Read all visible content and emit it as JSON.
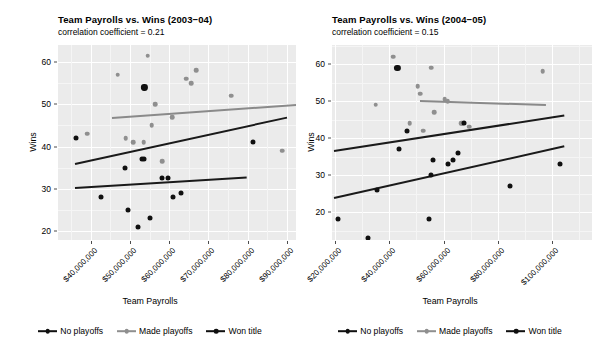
{
  "chart_data": [
    {
      "id": "facet-2003-04",
      "type": "scatter",
      "title": "Team Payrolls vs. Wins (2003−04)",
      "subtitle": "correlation coefficient = 0.21",
      "xlabel": "Team Payrolls",
      "ylabel": "Wins",
      "grid": true,
      "legend_position": "bottom",
      "xlim": [
        34500000,
        95000000
      ],
      "ylim": [
        18.5,
        63
      ],
      "xticks": [
        40000000,
        50000000,
        60000000,
        70000000,
        80000000,
        90000000
      ],
      "xtick_labels": [
        "$40,000,000",
        "$50,000,000",
        "$60,000,000",
        "$70,000,000",
        "$80,000,000",
        "$90,000,000"
      ],
      "yticks": [
        20,
        30,
        40,
        50,
        60
      ],
      "ytick_labels": [
        "20",
        "30",
        "40",
        "50",
        "60"
      ],
      "series": [
        {
          "name": "No playoffs",
          "color": "#101010",
          "points": [
            {
              "x": 36200000,
              "y": 42
            },
            {
              "x": 42500000,
              "y": 28
            },
            {
              "x": 48700000,
              "y": 35
            },
            {
              "x": 49600000,
              "y": 25
            },
            {
              "x": 52000000,
              "y": 21
            },
            {
              "x": 53000000,
              "y": 37
            },
            {
              "x": 53600000,
              "y": 37
            },
            {
              "x": 55100000,
              "y": 23
            },
            {
              "x": 58100000,
              "y": 32.5
            },
            {
              "x": 59600000,
              "y": 32.5
            },
            {
              "x": 61000000,
              "y": 28
            },
            {
              "x": 63000000,
              "y": 29
            },
            {
              "x": 81500000,
              "y": 41
            }
          ]
        },
        {
          "name": "Made playoffs",
          "color": "#8f8f8f",
          "points": [
            {
              "x": 39100000,
              "y": 43
            },
            {
              "x": 46900000,
              "y": 57
            },
            {
              "x": 48900000,
              "y": 42
            },
            {
              "x": 50900000,
              "y": 41
            },
            {
              "x": 53500000,
              "y": 41
            },
            {
              "x": 54500000,
              "y": 61.5
            },
            {
              "x": 55600000,
              "y": 45
            },
            {
              "x": 56400000,
              "y": 50
            },
            {
              "x": 58300000,
              "y": 36.5
            },
            {
              "x": 60800000,
              "y": 47
            },
            {
              "x": 64400000,
              "y": 56
            },
            {
              "x": 65600000,
              "y": 55
            },
            {
              "x": 66900000,
              "y": 58
            },
            {
              "x": 75800000,
              "y": 52
            },
            {
              "x": 88800000,
              "y": 39
            }
          ]
        },
        {
          "name": "Won title",
          "color": "#101010",
          "points": [
            {
              "x": 53700000,
              "y": 54
            }
          ]
        }
      ],
      "fit_lines": [
        {
          "series": "Made playoffs",
          "color": "#8a8a8a",
          "x1": 45500000,
          "y1": 47,
          "x2": 94000000,
          "y2": 50.2
        },
        {
          "series": "Won title",
          "color": "#1a1a1a",
          "x1": 36000000,
          "y1": 36,
          "x2": 90200000,
          "y2": 47
        },
        {
          "series": "No playoffs",
          "color": "#1a1a1a",
          "x1": 36000000,
          "y1": 30.4,
          "x2": 79800000,
          "y2": 32.9
        }
      ]
    },
    {
      "id": "facet-2004-05",
      "type": "scatter",
      "title": "Team Payrolls vs. Wins (2004−05)",
      "subtitle": "correlation coefficient = 0.15",
      "xlabel": "Team Payrolls",
      "ylabel": "Wins",
      "grid": true,
      "legend_position": "bottom",
      "xlim": [
        17000000,
        110000000
      ],
      "ylim": [
        11,
        64
      ],
      "xticks": [
        20000000,
        40000000,
        60000000,
        80000000,
        100000000
      ],
      "xtick_labels": [
        "$20,000,000",
        "$40,000,000",
        "$60,000,000",
        "$80,000,000",
        "$100,000,000"
      ],
      "yticks": [
        20,
        30,
        40,
        50,
        60
      ],
      "ytick_labels": [
        "20",
        "30",
        "40",
        "50",
        "60"
      ],
      "series": [
        {
          "name": "No playoffs",
          "color": "#101010",
          "points": [
            {
              "x": 21000000,
              "y": 18
            },
            {
              "x": 32000000,
              "y": 13
            },
            {
              "x": 35500000,
              "y": 26
            },
            {
              "x": 43500000,
              "y": 37
            },
            {
              "x": 46500000,
              "y": 42
            },
            {
              "x": 54500000,
              "y": 18
            },
            {
              "x": 55500000,
              "y": 30
            },
            {
              "x": 56000000,
              "y": 34
            },
            {
              "x": 61500000,
              "y": 33
            },
            {
              "x": 63500000,
              "y": 34
            },
            {
              "x": 65500000,
              "y": 36
            },
            {
              "x": 67500000,
              "y": 44
            },
            {
              "x": 84500000,
              "y": 27
            },
            {
              "x": 103000000,
              "y": 33
            }
          ]
        },
        {
          "name": "Made playoffs",
          "color": "#8f8f8f",
          "points": [
            {
              "x": 35000000,
              "y": 49
            },
            {
              "x": 41500000,
              "y": 62
            },
            {
              "x": 47500000,
              "y": 44
            },
            {
              "x": 50500000,
              "y": 54
            },
            {
              "x": 51500000,
              "y": 52
            },
            {
              "x": 52500000,
              "y": 42
            },
            {
              "x": 55500000,
              "y": 59
            },
            {
              "x": 56500000,
              "y": 47
            },
            {
              "x": 60500000,
              "y": 50.5
            },
            {
              "x": 61500000,
              "y": 50
            },
            {
              "x": 66500000,
              "y": 44
            },
            {
              "x": 67000000,
              "y": 44
            },
            {
              "x": 69500000,
              "y": 43
            },
            {
              "x": 96500000,
              "y": 58
            }
          ]
        },
        {
          "name": "Won title",
          "color": "#101010",
          "points": [
            {
              "x": 43000000,
              "y": 59
            }
          ]
        }
      ],
      "fit_lines": [
        {
          "series": "Made playoffs",
          "color": "#8a8a8a",
          "x1": 51500000,
          "y1": 50.3,
          "x2": 98000000,
          "y2": 49.2
        },
        {
          "series": "Won title",
          "color": "#1a1a1a",
          "x1": 19500000,
          "y1": 36.7,
          "x2": 104500000,
          "y2": 46.3
        },
        {
          "series": "No playoffs",
          "color": "#1a1a1a",
          "x1": 19500000,
          "y1": 24,
          "x2": 104500000,
          "y2": 38
        }
      ]
    }
  ],
  "legend": {
    "items": [
      {
        "label": "No playoffs",
        "color": "#101010"
      },
      {
        "label": "Made playoffs",
        "color": "#8f8f8f"
      },
      {
        "label": "Won title",
        "color": "#101010"
      }
    ]
  }
}
